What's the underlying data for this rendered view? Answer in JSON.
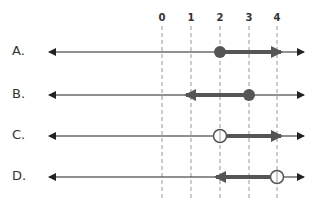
{
  "diagram": {
    "tick_labels": [
      "0",
      "1",
      "2",
      "3",
      "4"
    ],
    "tick_x": [
      162,
      191,
      220,
      249,
      277
    ],
    "line_x_start": 47,
    "line_x_end": 305,
    "options": [
      {
        "label": "A.",
        "y": 52,
        "endpoint": 2,
        "endpoint_type": "closed",
        "direction": "right"
      },
      {
        "label": "B.",
        "y": 95,
        "endpoint": 3,
        "endpoint_type": "closed",
        "direction": "left"
      },
      {
        "label": "C.",
        "y": 136,
        "endpoint": 2,
        "endpoint_type": "open",
        "direction": "right"
      },
      {
        "label": "D.",
        "y": 177,
        "endpoint": 4,
        "endpoint_type": "open",
        "direction": "left"
      }
    ],
    "colors": {
      "axis": "#222222",
      "ray": "#555555",
      "dot": "#555555",
      "dashed": "#999999",
      "text": "#333333"
    }
  }
}
